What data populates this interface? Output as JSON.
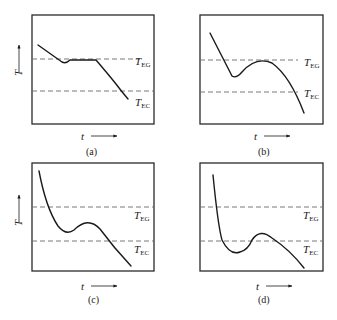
{
  "figure": {
    "panels": [
      {
        "id": "a",
        "caption": "(a)",
        "teg_label": "T",
        "teg_sub": "EG",
        "tec_label": "T",
        "tec_sub": "EC",
        "x_axis": "t",
        "y_axis": "T",
        "show_y_axis": true
      },
      {
        "id": "b",
        "caption": "(b)",
        "teg_label": "T",
        "teg_sub": "EG",
        "tec_label": "T",
        "tec_sub": "EC",
        "x_axis": "t",
        "y_axis": "",
        "show_y_axis": false
      },
      {
        "id": "c",
        "caption": "(c)",
        "teg_label": "T",
        "teg_sub": "EG",
        "tec_label": "T",
        "tec_sub": "EC",
        "x_axis": "t",
        "y_axis": "T",
        "show_y_axis": true
      },
      {
        "id": "d",
        "caption": "(d)",
        "teg_label": "T",
        "teg_sub": "EG",
        "tec_label": "T",
        "tec_sub": "EC",
        "x_axis": "t",
        "y_axis": "",
        "show_y_axis": false
      }
    ]
  }
}
